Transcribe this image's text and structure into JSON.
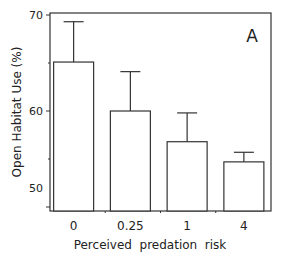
{
  "chart_data": {
    "type": "bar",
    "title": "",
    "panel_label": "A",
    "xlabel": "Perceived  predation  risk",
    "ylabel": "Open Habitat Use (%)",
    "categories": [
      "0",
      "0.25",
      "1",
      "4"
    ],
    "values": [
      65.1,
      60.0,
      56.8,
      54.7
    ],
    "error_upper": [
      69.3,
      64.1,
      59.8,
      55.7
    ],
    "ylim": [
      48,
      70
    ],
    "yticks": [
      50,
      60,
      70
    ],
    "grid": false,
    "legend": null,
    "bar_fill": "#ffffff",
    "bar_stroke": "#333333"
  }
}
